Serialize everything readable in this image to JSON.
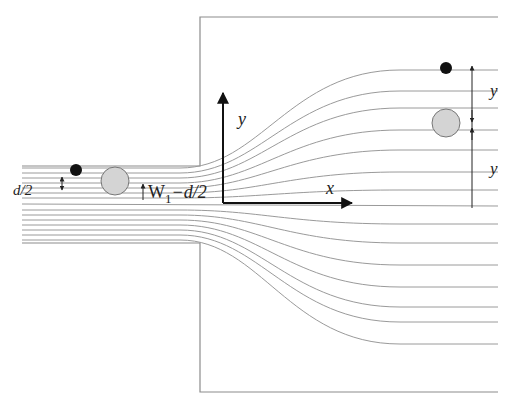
{
  "figure": {
    "labels": {
      "d_half": "d/2",
      "w1_label_main": "W",
      "w1_label_sub": "1",
      "w1_label_rest": "−d/2",
      "axis_x": "x",
      "axis_y": "y",
      "right_y_upper": "y",
      "right_y_lower": "y"
    },
    "colors": {
      "streamline": "#9a9a9a",
      "wall": "#8c8c8c",
      "axis": "#111111",
      "particle_small": "#111111",
      "particle_large_fill": "#d4d4d4",
      "particle_large_stroke": "#777777"
    }
  }
}
